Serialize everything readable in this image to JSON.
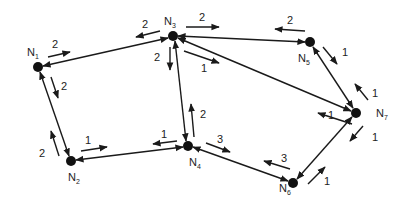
{
  "diagram": {
    "type": "network-graph",
    "nodes": [
      {
        "id": "N1",
        "label": "N",
        "sub": "1",
        "x": 38,
        "y": 67
      },
      {
        "id": "N2",
        "label": "N",
        "sub": "2",
        "x": 71,
        "y": 161
      },
      {
        "id": "N3",
        "label": "N",
        "sub": "3",
        "x": 173,
        "y": 36
      },
      {
        "id": "N4",
        "label": "N",
        "sub": "4",
        "x": 188,
        "y": 146
      },
      {
        "id": "N5",
        "label": "N",
        "sub": "5",
        "x": 310,
        "y": 42
      },
      {
        "id": "N6",
        "label": "N",
        "sub": "6",
        "x": 293,
        "y": 183
      },
      {
        "id": "N7",
        "label": "N",
        "sub": "7",
        "x": 356,
        "y": 113
      }
    ],
    "edges": [
      {
        "from": "N1",
        "to": "N3",
        "cost_forward": "2",
        "cost_backward": "2"
      },
      {
        "from": "N1",
        "to": "N2",
        "cost_forward": "2",
        "cost_backward": "2"
      },
      {
        "from": "N2",
        "to": "N4",
        "cost_forward": "1",
        "cost_backward": "1"
      },
      {
        "from": "N3",
        "to": "N4",
        "cost_forward": "2",
        "cost_backward": "2"
      },
      {
        "from": "N3",
        "to": "N5",
        "cost_forward": "2",
        "cost_backward": "2"
      },
      {
        "from": "N3",
        "to": "N7",
        "cost_forward": "1",
        "cost_backward": "1"
      },
      {
        "from": "N4",
        "to": "N6",
        "cost_forward": "3",
        "cost_backward": "3"
      },
      {
        "from": "N5",
        "to": "N7",
        "cost_forward": "1",
        "cost_backward": "1"
      },
      {
        "from": "N6",
        "to": "N7",
        "cost_forward": "1",
        "cost_backward": "1"
      }
    ],
    "labels": {
      "n1": {
        "main": "N",
        "sub": "1"
      },
      "n2": {
        "main": "N",
        "sub": "2"
      },
      "n3": {
        "main": "N",
        "sub": "3"
      },
      "n4": {
        "main": "N",
        "sub": "4"
      },
      "n5": {
        "main": "N",
        "sub": "5"
      },
      "n6": {
        "main": "N",
        "sub": "6"
      },
      "n7": {
        "main": "N",
        "sub": "7"
      },
      "w_n1_n3_fwd": "2",
      "w_n3_n1_back": "2",
      "w_n1_n2_down": "2",
      "w_n2_n1_up": "2",
      "w_n2_n4_fwd": "1",
      "w_n4_n2_back": "1",
      "w_n3_n4_down": "2",
      "w_n4_n3_up": "2",
      "w_n3_n5_fwd": "2",
      "w_n5_n3_back": "2",
      "w_n3_n7_fwd": "1",
      "w_n7_n3_back": "1",
      "w_n4_n6_fwd": "3",
      "w_n6_n4_back": "3",
      "w_n5_n7_down": "1",
      "w_n7_n5_up": "1",
      "w_n7_n6_down": "1",
      "w_n6_n7_up": "1"
    },
    "colors": {
      "stroke": "#1a1a1a",
      "node": "#111111",
      "text": "#222222",
      "background": "#ffffff"
    }
  }
}
